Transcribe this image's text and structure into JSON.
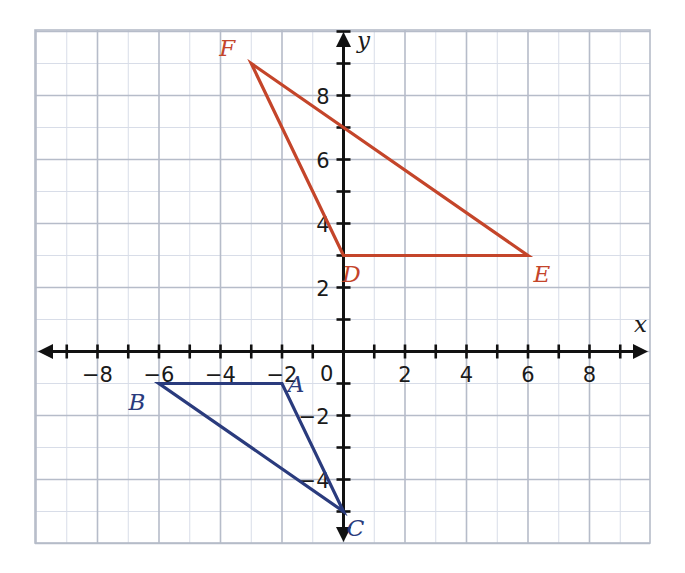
{
  "figure": {
    "kind": "coordinate-plane",
    "background_color": "#ffffff",
    "grid": {
      "minor_color": "#d8dde8",
      "major_color": "#b6bcc9",
      "border_color": "#b6bcc9",
      "visible": true,
      "step": 1,
      "major_every": 2
    },
    "axes": {
      "color": "#111111",
      "x_label": "x",
      "y_label": "y",
      "origin_label": "0",
      "x_range": [
        -9.5,
        9.5
      ],
      "y_range": [
        -6.2,
        10.2
      ],
      "x_tick_labels": [
        "-8",
        "-6",
        "-4",
        "-2",
        "2",
        "4",
        "6",
        "8"
      ],
      "x_tick_values": [
        -8,
        -6,
        -4,
        -2,
        2,
        4,
        6,
        8
      ],
      "y_tick_labels": [
        "8",
        "6",
        "4",
        "2",
        "-2",
        "-4"
      ],
      "y_tick_values": [
        8,
        6,
        4,
        2,
        -2,
        -4
      ],
      "tick_step": 1,
      "labeled_tick_step": 2
    }
  },
  "chart_data": {
    "type": "scatter",
    "title": "",
    "xlabel": "x",
    "ylabel": "y",
    "xlim": [
      -9.5,
      9.5
    ],
    "ylim": [
      -6.2,
      10.2
    ],
    "grid": true,
    "legend": "none",
    "series": [
      {
        "name": "Triangle ABC",
        "color": "#2a3b7d",
        "closed": true,
        "points": [
          {
            "label": "A",
            "x": -2,
            "y": -1,
            "label_dx": 14,
            "label_dy": 8
          },
          {
            "label": "B",
            "x": -6,
            "y": -1,
            "label_dx": -22,
            "label_dy": 26
          },
          {
            "label": "C",
            "x": 0,
            "y": -5,
            "label_dx": 12,
            "label_dy": 24
          }
        ]
      },
      {
        "name": "Triangle DEF",
        "color": "#c4452a",
        "closed": true,
        "points": [
          {
            "label": "D",
            "x": 0,
            "y": 3,
            "label_dx": 8,
            "label_dy": 26
          },
          {
            "label": "E",
            "x": 6,
            "y": 3,
            "label_dx": 14,
            "label_dy": 26
          },
          {
            "label": "F",
            "x": -3,
            "y": 9,
            "label_dx": -24,
            "label_dy": -8
          }
        ]
      }
    ]
  },
  "labels": {
    "A": "A",
    "B": "B",
    "C": "C",
    "D": "D",
    "E": "E",
    "F": "F",
    "x": "x",
    "y": "y",
    "zero": "0"
  },
  "colors": {
    "red": "#c4452a",
    "blue": "#2a3b7d",
    "axis": "#111111",
    "grid_minor": "#d8dde8",
    "grid_major": "#b6bcc9"
  }
}
